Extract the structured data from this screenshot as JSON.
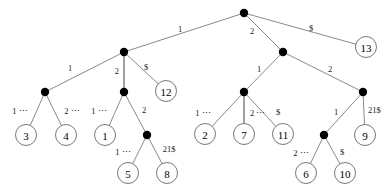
{
  "figure": {
    "kind": "suffix-tree-diagram",
    "width": 392,
    "height": 196,
    "background_color": "#ffffff",
    "edge_color": "#6b6b6b",
    "internal_node_color": "#000000",
    "leaf_fill_color": "#ffffff",
    "leaf_stroke_color": "#555555",
    "text_color": "#000000"
  },
  "nodes": {
    "root": {
      "id": "root",
      "type": "internal",
      "x": 244,
      "y": 13,
      "r": 4.2
    },
    "L1": {
      "id": "L1",
      "type": "internal",
      "x": 124,
      "y": 52,
      "r": 4.2
    },
    "R1": {
      "id": "R1",
      "type": "internal",
      "x": 283,
      "y": 52,
      "r": 4.2
    },
    "L2a": {
      "id": "L2a",
      "type": "internal",
      "x": 45,
      "y": 92,
      "r": 4.2
    },
    "L2b": {
      "id": "L2b",
      "type": "internal",
      "x": 124,
      "y": 92,
      "r": 4.2
    },
    "R2a": {
      "id": "R2a",
      "type": "internal",
      "x": 244,
      "y": 92,
      "r": 4.2
    },
    "R2b": {
      "id": "R2b",
      "type": "internal",
      "x": 363,
      "y": 92,
      "r": 4.2
    },
    "L3": {
      "id": "L3",
      "type": "internal",
      "x": 147,
      "y": 135,
      "r": 4.2
    },
    "R3": {
      "id": "R3",
      "type": "internal",
      "x": 324,
      "y": 135,
      "r": 4.2
    }
  },
  "leaves": [
    {
      "id": "leaf13",
      "label": "13",
      "x": 366,
      "y": 47,
      "r": 10.5
    },
    {
      "id": "leaf12",
      "label": "12",
      "x": 166,
      "y": 91,
      "r": 10.5
    },
    {
      "id": "leaf3",
      "label": "3",
      "x": 26,
      "y": 135,
      "r": 10.5
    },
    {
      "id": "leaf4",
      "label": "4",
      "x": 66,
      "y": 135,
      "r": 10.5
    },
    {
      "id": "leaf1",
      "label": "1",
      "x": 105,
      "y": 135,
      "r": 10.5
    },
    {
      "id": "leaf2",
      "label": "2",
      "x": 205,
      "y": 134,
      "r": 10.5
    },
    {
      "id": "leaf7",
      "label": "7",
      "x": 244,
      "y": 134,
      "r": 10.5
    },
    {
      "id": "leaf11",
      "label": "11",
      "x": 283,
      "y": 134,
      "r": 10.5
    },
    {
      "id": "leaf9",
      "label": "9",
      "x": 365,
      "y": 135,
      "r": 10.5
    },
    {
      "id": "leaf5",
      "label": "5",
      "x": 128,
      "y": 173,
      "r": 10.5
    },
    {
      "id": "leaf8",
      "label": "8",
      "x": 167,
      "y": 173,
      "r": 10.5
    },
    {
      "id": "leaf6",
      "label": "6",
      "x": 306,
      "y": 173,
      "r": 10.5
    },
    {
      "id": "leaf10",
      "label": "10",
      "x": 345,
      "y": 173,
      "r": 10.5
    }
  ],
  "edges": [
    {
      "id": "e-root-L1",
      "from": "root",
      "to": "L1",
      "thick": false,
      "label": "1",
      "lx": 180,
      "ly": 29,
      "anchor": "middle"
    },
    {
      "id": "e-root-R1",
      "from": "root",
      "to": "R1",
      "thick": false,
      "label": "2",
      "lx": 250,
      "ly": 31,
      "anchor": "start"
    },
    {
      "id": "e-root-leaf13",
      "from": "root",
      "to": "leaf13",
      "thick": false,
      "label": "$",
      "lx": 311,
      "ly": 28,
      "anchor": "middle"
    },
    {
      "id": "e-L1-L2a",
      "from": "L1",
      "to": "L2a",
      "thick": false,
      "label": "1",
      "lx": 70,
      "ly": 68,
      "anchor": "middle"
    },
    {
      "id": "e-L1-L2b",
      "from": "L1",
      "to": "L2b",
      "thick": true,
      "label": "2",
      "lx": 119,
      "ly": 71,
      "anchor": "end"
    },
    {
      "id": "e-L1-leaf12",
      "from": "L1",
      "to": "leaf12",
      "thick": false,
      "label": "$",
      "lx": 146,
      "ly": 67,
      "anchor": "middle"
    },
    {
      "id": "e-L2a-leaf3",
      "from": "L2a",
      "to": "leaf3",
      "thick": false,
      "label": "1 ⋯",
      "lx": 20,
      "ly": 111,
      "anchor": "middle"
    },
    {
      "id": "e-L2a-leaf4",
      "from": "L2a",
      "to": "leaf4",
      "thick": false,
      "label": "2 ⋯",
      "lx": 72,
      "ly": 111,
      "anchor": "middle"
    },
    {
      "id": "e-L2b-leaf1",
      "from": "L2b",
      "to": "leaf1",
      "thick": false,
      "label": "1 ⋯",
      "lx": 99,
      "ly": 111,
      "anchor": "middle"
    },
    {
      "id": "e-L2b-L3",
      "from": "L2b",
      "to": "L3",
      "thick": false,
      "label": "2",
      "lx": 144,
      "ly": 110,
      "anchor": "middle"
    },
    {
      "id": "e-L3-leaf5",
      "from": "L3",
      "to": "leaf5",
      "thick": false,
      "label": "1 ⋯",
      "lx": 123,
      "ly": 152,
      "anchor": "middle"
    },
    {
      "id": "e-L3-leaf8",
      "from": "L3",
      "to": "leaf8",
      "thick": false,
      "label": "21$",
      "lx": 169,
      "ly": 149,
      "anchor": "middle"
    },
    {
      "id": "e-R1-R2a",
      "from": "R1",
      "to": "R2a",
      "thick": false,
      "label": "1",
      "lx": 259,
      "ly": 69,
      "anchor": "middle"
    },
    {
      "id": "e-R1-R2b",
      "from": "R1",
      "to": "R2b",
      "thick": false,
      "label": "2",
      "lx": 330,
      "ly": 69,
      "anchor": "middle"
    },
    {
      "id": "e-R2a-leaf2",
      "from": "R2a",
      "to": "leaf2",
      "thick": false,
      "label": "1 ⋯",
      "lx": 203,
      "ly": 113,
      "anchor": "middle"
    },
    {
      "id": "e-R2a-leaf7",
      "from": "R2a",
      "to": "leaf7",
      "thick": true,
      "label": "2 ⋯",
      "lx": 250,
      "ly": 113,
      "anchor": "start"
    },
    {
      "id": "e-R2a-leaf11",
      "from": "R2a",
      "to": "leaf11",
      "thick": false,
      "label": "$",
      "lx": 278,
      "ly": 112,
      "anchor": "middle"
    },
    {
      "id": "e-R2b-R3",
      "from": "R2b",
      "to": "R3",
      "thick": false,
      "label": "1",
      "lx": 336,
      "ly": 112,
      "anchor": "middle"
    },
    {
      "id": "e-R2b-leaf9",
      "from": "R2b",
      "to": "leaf9",
      "thick": false,
      "label": "21$",
      "lx": 368,
      "ly": 110,
      "anchor": "start"
    },
    {
      "id": "e-R3-leaf6",
      "from": "R3",
      "to": "leaf6",
      "thick": false,
      "label": "2 ⋯",
      "lx": 301,
      "ly": 153,
      "anchor": "middle"
    },
    {
      "id": "e-R3-leaf10",
      "from": "R3",
      "to": "leaf10",
      "thick": false,
      "label": "$",
      "lx": 342,
      "ly": 152,
      "anchor": "middle"
    }
  ]
}
